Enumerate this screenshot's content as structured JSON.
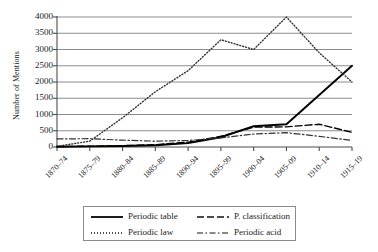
{
  "chart_data": {
    "type": "line",
    "title": "",
    "xlabel": "",
    "ylabel": "Number of Mentions",
    "ylim": [
      0,
      4000
    ],
    "ytick_step": 500,
    "yticks": [
      0,
      500,
      1000,
      1500,
      2000,
      2500,
      3000,
      3500,
      4000
    ],
    "grid": "horizontal",
    "legend_position": "bottom",
    "categories": [
      "1870–74",
      "1875–79",
      "1880–84",
      "1885–89",
      "1890–94",
      "1895–99",
      "1900–04",
      "1905–09",
      "1910–14",
      "1915–19"
    ],
    "series": [
      {
        "name": "Periodic table",
        "style": "solid",
        "color": "#000000",
        "values": [
          10,
          20,
          30,
          55,
          120,
          300,
          640,
          700,
          1600,
          2500
        ]
      },
      {
        "name": "Periodic law",
        "style": "dotted",
        "color": "#333333",
        "values": [
          20,
          180,
          900,
          1700,
          2350,
          3300,
          3000,
          4000,
          2900,
          2000
        ]
      },
      {
        "name": "P. classification",
        "style": "dashed",
        "color": "#000000",
        "values": [
          15,
          25,
          40,
          70,
          150,
          330,
          610,
          620,
          700,
          450
        ]
      },
      {
        "name": "Periodic acid",
        "style": "dashdot",
        "color": "#333333",
        "values": [
          250,
          255,
          210,
          180,
          200,
          280,
          400,
          440,
          330,
          200
        ]
      }
    ]
  },
  "legend": {
    "entries": [
      {
        "label": "Periodic table",
        "style": "solid"
      },
      {
        "label": "P. classification",
        "style": "dashed"
      },
      {
        "label": "Periodic law",
        "style": "dotted"
      },
      {
        "label": "Periodic acid",
        "style": "dashdot"
      }
    ]
  }
}
